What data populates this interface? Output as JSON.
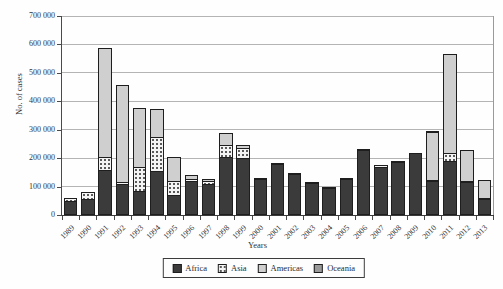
{
  "figure": {
    "background": "#fefefe",
    "gridline_color": "#b4b4b4",
    "axis_color": "#3a3a3a",
    "y_tick_labels": [
      "0",
      "100 000",
      "200 000",
      "300 000",
      "400 000",
      "500 000",
      "600 000",
      "700 000"
    ]
  },
  "chart_data": {
    "type": "bar",
    "stacked": true,
    "title": "",
    "xlabel": "Years",
    "ylabel": "No. of cases",
    "ylim": [
      0,
      700000
    ],
    "ytick_step": 100000,
    "grid": true,
    "legend_position": "bottom",
    "categories": [
      "1989",
      "1990",
      "1991",
      "1992",
      "1993",
      "1994",
      "1995",
      "1996",
      "1997",
      "1998",
      "1999",
      "2000",
      "2001",
      "2002",
      "2003",
      "2004",
      "2005",
      "2006",
      "2007",
      "2008",
      "2009",
      "2010",
      "2011",
      "2012",
      "2013"
    ],
    "series": [
      {
        "name": "Africa",
        "color": "#3b3b3b",
        "pattern": "solid",
        "values": [
          50000,
          55000,
          158000,
          108000,
          84000,
          155000,
          72000,
          118000,
          108000,
          205000,
          200000,
          125000,
          180000,
          143000,
          111000,
          95000,
          125000,
          230000,
          170000,
          185000,
          217000,
          118000,
          190000,
          116000,
          55000
        ]
      },
      {
        "name": "Asia",
        "color": "#f4f4f4",
        "pattern": "dots",
        "values": [
          12000,
          30000,
          50000,
          12000,
          88000,
          123000,
          50000,
          13000,
          14000,
          45000,
          40000,
          10000,
          6000,
          6000,
          5000,
          5000,
          8000,
          0,
          11000,
          7000,
          0,
          8000,
          32000,
          8000,
          10000
        ]
      },
      {
        "name": "Americas",
        "color": "#cfcfcf",
        "pattern": "solid",
        "values": [
          0,
          0,
          387000,
          343000,
          213000,
          102000,
          88000,
          17000,
          12000,
          45000,
          15000,
          0,
          0,
          0,
          0,
          0,
          0,
          0,
          0,
          0,
          0,
          172000,
          353000,
          113000,
          66000
        ]
      },
      {
        "name": "Oceania",
        "color": "#9a9a9a",
        "pattern": "solid",
        "values": [
          0,
          0,
          0,
          0,
          0,
          0,
          0,
          0,
          0,
          0,
          0,
          0,
          0,
          0,
          0,
          0,
          0,
          5000,
          0,
          0,
          0,
          9000,
          0,
          0,
          0
        ]
      }
    ]
  }
}
